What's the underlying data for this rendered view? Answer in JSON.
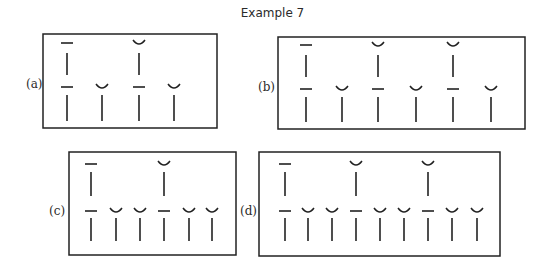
{
  "title": "Example 7",
  "colors": {
    "ink": "#222222",
    "background": "#ffffff"
  },
  "symbols": {
    "long": "macron (—)",
    "short": "breve (◡)"
  },
  "panels": [
    {
      "id": "a",
      "label": "(a)",
      "box": {
        "x": 43,
        "y": 34,
        "w": 174,
        "h": 94
      },
      "label_pos": {
        "x": 26,
        "y": 77
      },
      "upper": [
        {
          "x": 67,
          "mark": "long"
        },
        {
          "x": 139,
          "mark": "short"
        }
      ],
      "lower": [
        {
          "x": 67,
          "mark": "long"
        },
        {
          "x": 102,
          "mark": "short"
        },
        {
          "x": 139,
          "mark": "long"
        },
        {
          "x": 174,
          "mark": "short"
        }
      ],
      "rows": {
        "upper_mark": 43,
        "upper_stem": [
          53,
          75
        ],
        "lower_mark": 87,
        "lower_stem": [
          95,
          121
        ]
      }
    },
    {
      "id": "b",
      "label": "(b)",
      "box": {
        "x": 278,
        "y": 37,
        "w": 247,
        "h": 92
      },
      "label_pos": {
        "x": 258,
        "y": 80
      },
      "upper": [
        {
          "x": 306,
          "mark": "long"
        },
        {
          "x": 378,
          "mark": "short"
        },
        {
          "x": 453,
          "mark": "short"
        }
      ],
      "lower": [
        {
          "x": 306,
          "mark": "long"
        },
        {
          "x": 342,
          "mark": "short"
        },
        {
          "x": 378,
          "mark": "long"
        },
        {
          "x": 416,
          "mark": "short"
        },
        {
          "x": 453,
          "mark": "long"
        },
        {
          "x": 491,
          "mark": "short"
        }
      ],
      "rows": {
        "upper_mark": 45,
        "upper_stem": [
          55,
          77
        ],
        "lower_mark": 89,
        "lower_stem": [
          97,
          122
        ]
      }
    },
    {
      "id": "c",
      "label": "(c)",
      "box": {
        "x": 69,
        "y": 152,
        "w": 167,
        "h": 103
      },
      "label_pos": {
        "x": 49,
        "y": 204
      },
      "upper": [
        {
          "x": 91,
          "mark": "long"
        },
        {
          "x": 164,
          "mark": "short"
        }
      ],
      "lower": [
        {
          "x": 91,
          "mark": "long"
        },
        {
          "x": 116,
          "mark": "short"
        },
        {
          "x": 140,
          "mark": "short"
        },
        {
          "x": 164,
          "mark": "long"
        },
        {
          "x": 189,
          "mark": "short"
        },
        {
          "x": 212,
          "mark": "short"
        }
      ],
      "rows": {
        "upper_mark": 164,
        "upper_stem": [
          172,
          196
        ],
        "lower_mark": 211,
        "lower_stem": [
          218,
          241
        ]
      }
    },
    {
      "id": "d",
      "label": "(d)",
      "box": {
        "x": 259,
        "y": 152,
        "w": 241,
        "h": 104
      },
      "label_pos": {
        "x": 240,
        "y": 204
      },
      "upper": [
        {
          "x": 285,
          "mark": "long"
        },
        {
          "x": 356,
          "mark": "short"
        },
        {
          "x": 428,
          "mark": "short"
        }
      ],
      "lower": [
        {
          "x": 285,
          "mark": "long"
        },
        {
          "x": 308,
          "mark": "short"
        },
        {
          "x": 332,
          "mark": "short"
        },
        {
          "x": 356,
          "mark": "long"
        },
        {
          "x": 380,
          "mark": "short"
        },
        {
          "x": 404,
          "mark": "short"
        },
        {
          "x": 428,
          "mark": "long"
        },
        {
          "x": 452,
          "mark": "short"
        },
        {
          "x": 477,
          "mark": "short"
        }
      ],
      "rows": {
        "upper_mark": 164,
        "upper_stem": [
          172,
          196
        ],
        "lower_mark": 211,
        "lower_stem": [
          218,
          241
        ]
      }
    }
  ]
}
